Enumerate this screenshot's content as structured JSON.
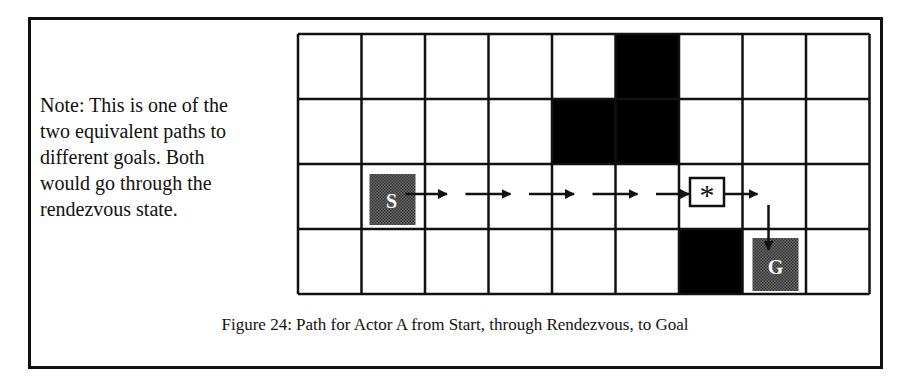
{
  "note": {
    "lines": [
      "Note: This is one of the",
      "two equivalent paths to",
      "different goals. Both",
      "would go through the",
      "rendezvous state."
    ]
  },
  "grid": {
    "columns": 9,
    "rows": 4,
    "origin_x": 298,
    "origin_y": 34,
    "cell_w": 63.5,
    "cell_h": 65,
    "obstacle_cells": [
      {
        "row": 0,
        "col": 5
      },
      {
        "row": 1,
        "col": 4
      },
      {
        "row": 1,
        "col": 5
      },
      {
        "row": 3,
        "col": 6
      }
    ],
    "start": {
      "row": 2,
      "col": 1,
      "label": "S"
    },
    "rendezvous": {
      "row": 2,
      "col": 6,
      "label": "*"
    },
    "goal": {
      "row": 3,
      "col": 7,
      "label": "G"
    },
    "colors": {
      "grid_line": "#111111",
      "obstacle": "#000000",
      "marker_fill": "#555555",
      "marker_text": "#ffffff"
    }
  },
  "caption": "Figure 24: Path for Actor A from Start, through Rendezvous, to Goal"
}
